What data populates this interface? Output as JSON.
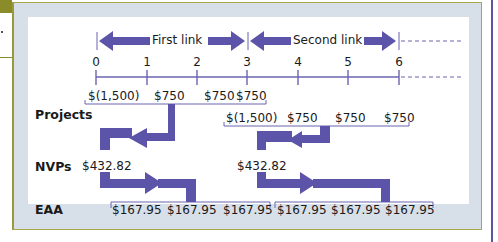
{
  "diagram": {
    "links": [
      {
        "label": "First link",
        "from_period": 0,
        "to_period": 3
      },
      {
        "label": "Second link",
        "from_period": 3,
        "to_period": 6
      }
    ],
    "timeline": {
      "periods": [
        "0",
        "1",
        "2",
        "3",
        "4",
        "5",
        "6"
      ],
      "continues_beyond": true
    },
    "rows": {
      "projects": {
        "label": "Projects",
        "first_chain": [
          "$(1,500)",
          "$750",
          "$750",
          "$750"
        ],
        "second_chain": [
          "$(1,500)",
          "$750",
          "$750",
          "$750"
        ]
      },
      "npvs": {
        "label": "NVPs",
        "first_value": "$432.82",
        "second_value": "$432.82"
      },
      "eaa": {
        "label": "EAA",
        "first_chain": [
          "$167.95",
          "$167.95",
          "$167.95"
        ],
        "second_chain": [
          "$167.95",
          "$167.95",
          "$167.95"
        ]
      }
    },
    "colors": {
      "arrow": "#5b54a8",
      "axis": "#6a64b0",
      "frame_fill": "#d7dfe9",
      "frame_border": "#a6a64a",
      "corner_tab": "#8a8c2a"
    }
  }
}
